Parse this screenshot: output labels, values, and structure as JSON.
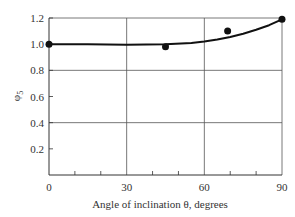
{
  "chart_data": {
    "type": "line",
    "title": "",
    "xlabel": "Angle of inclination θ, degrees",
    "ylabel": "φ5",
    "xlim": [
      0,
      90
    ],
    "ylim": [
      0,
      1.2
    ],
    "x_ticks": [
      0,
      30,
      60,
      90
    ],
    "x_tick_labels": [
      "0",
      "30",
      "60",
      "90"
    ],
    "x_minor_ticks": [
      10,
      20,
      40,
      50,
      70,
      80
    ],
    "y_ticks": [
      0.2,
      0.4,
      0.6,
      0.8,
      1.0,
      1.2
    ],
    "y_tick_labels": [
      "0.2",
      "0.4",
      "0.6",
      "0.8",
      "1.0",
      "1.2"
    ],
    "grid": {
      "x": [
        30,
        60
      ],
      "y": [
        0.4,
        0.8
      ]
    },
    "legend": null,
    "series": [
      {
        "name": "fitted curve",
        "kind": "line",
        "x": [
          0,
          15,
          30,
          45,
          55,
          60,
          65,
          70,
          75,
          80,
          85,
          90
        ],
        "values": [
          1.0,
          1.0,
          0.995,
          1.0,
          1.01,
          1.02,
          1.035,
          1.055,
          1.08,
          1.11,
          1.145,
          1.19
        ]
      },
      {
        "name": "data points",
        "kind": "scatter",
        "x": [
          0,
          45,
          69,
          90
        ],
        "values": [
          1.0,
          0.98,
          1.1,
          1.19
        ]
      }
    ]
  },
  "labels": {
    "x_axis": "Angle of inclination θ, degrees",
    "y_axis_main": "φ",
    "y_axis_sub": "5"
  },
  "colors": {
    "line": "#111111",
    "grid": "#555555",
    "axis": "#333333"
  }
}
